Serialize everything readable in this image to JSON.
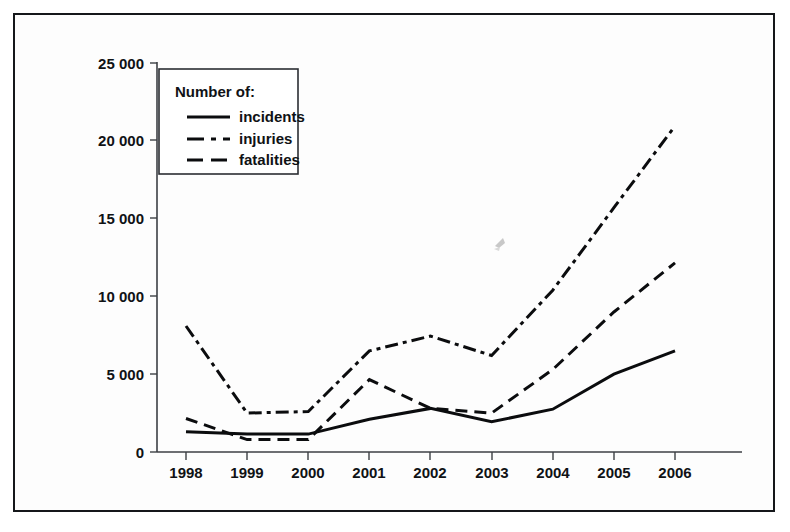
{
  "figure": {
    "border_color": "#15171a",
    "background": "#ffffff",
    "line_color": "#0b0c0e"
  },
  "legend": {
    "title": "Number of:",
    "entries": [
      {
        "label": "incidents",
        "style": "solid"
      },
      {
        "label": "injuries",
        "style": "dash-dot"
      },
      {
        "label": "fatalities",
        "style": "dashed"
      }
    ]
  },
  "axes": {
    "y_tick_labels": [
      "0",
      "5 000",
      "10 000",
      "15 000",
      "20 000",
      "25 000"
    ],
    "x_tick_labels": [
      "1998",
      "1999",
      "2000",
      "2001",
      "2002",
      "2003",
      "2004",
      "2005",
      "2006"
    ]
  },
  "chart_data": {
    "type": "line",
    "title": "",
    "xlabel": "",
    "ylabel": "",
    "categories": [
      "1998",
      "1999",
      "2000",
      "2001",
      "2002",
      "2003",
      "2004",
      "2005",
      "2006"
    ],
    "x": [
      1998,
      1999,
      2000,
      2001,
      2002,
      2003,
      2004,
      2005,
      2006
    ],
    "ylim": [
      0,
      25000
    ],
    "xlim": [
      1998,
      2006
    ],
    "yticks": [
      0,
      5000,
      10000,
      15000,
      20000,
      25000
    ],
    "ytick_labels": [
      "0",
      "5 000",
      "10 000",
      "15 000",
      "20 000",
      "25 000"
    ],
    "grid": false,
    "legend_position": "top-left",
    "series": [
      {
        "name": "incidents",
        "style": "solid",
        "values": [
          1300,
          1150,
          1150,
          2100,
          2800,
          1950,
          2750,
          5000,
          6500
        ]
      },
      {
        "name": "injuries",
        "style": "dash-dot",
        "values": [
          8100,
          2500,
          2600,
          6500,
          7450,
          6200,
          10400,
          15700,
          20950
        ]
      },
      {
        "name": "fatalities",
        "style": "dashed",
        "values": [
          2150,
          800,
          800,
          4650,
          2800,
          2500,
          5300,
          9000,
          12150
        ]
      }
    ]
  },
  "artifact": {
    "name": "scan-speck",
    "color": "#9a9a9a"
  }
}
